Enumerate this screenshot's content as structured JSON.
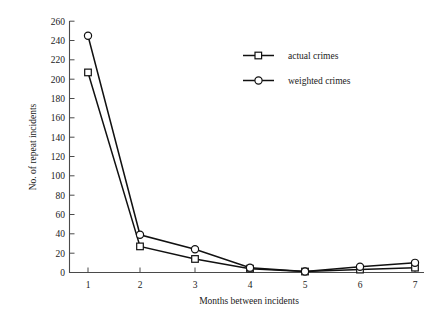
{
  "chart_data": {
    "type": "line",
    "title": "",
    "xlabel": "Months between incidents",
    "ylabel": "No. of repeat incidents",
    "x": [
      1,
      2,
      3,
      4,
      5,
      6,
      7
    ],
    "categories": [
      "1",
      "2",
      "3",
      "4",
      "5",
      "6",
      "7"
    ],
    "xlim": [
      0.6,
      7.4
    ],
    "ylim": [
      0,
      260
    ],
    "ytick_labels": [
      "0",
      "20",
      "40",
      "60",
      "80",
      "100",
      "120",
      "140",
      "160",
      "180",
      "200",
      "220",
      "240",
      "260"
    ],
    "ytick_values": [
      0,
      20,
      40,
      60,
      80,
      100,
      120,
      140,
      160,
      180,
      200,
      220,
      240,
      260
    ],
    "xtick_labels": [
      "1",
      "2",
      "3",
      "4",
      "5",
      "6",
      "7"
    ],
    "grid": false,
    "legend_position": "upper right",
    "series": [
      {
        "name": "actual crimes",
        "marker": "square",
        "values": [
          207,
          27,
          14,
          4,
          1,
          3,
          5
        ]
      },
      {
        "name": "weighted crimes",
        "marker": "circle",
        "values": [
          245,
          39,
          24,
          5,
          1,
          6,
          10
        ]
      }
    ],
    "colors": {
      "line": "#111111",
      "marker_fill": "#ffffff",
      "axis": "#4a4a4a",
      "text": "#1a1a1a",
      "background": "#ffffff"
    }
  },
  "legend": {
    "items": [
      {
        "label": "actual crimes",
        "marker": "square-marker"
      },
      {
        "label": "weighted crimes",
        "marker": "circle-marker"
      }
    ]
  }
}
